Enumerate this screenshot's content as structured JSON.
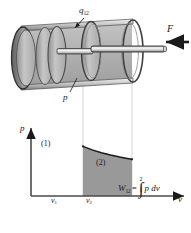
{
  "figure": {
    "colors": {
      "ink": "#1a1a1a",
      "cylinder_body": "#b8b8b8",
      "cylinder_shade_dark": "#6e6e6e",
      "cylinder_highlight": "#e2e2e2",
      "area_fill": "#999999",
      "projection_line": "#d2d2d2",
      "axis": "#4a4a4a"
    }
  },
  "apparatus": {
    "heat_label": "q",
    "heat_sub": "12",
    "force_label": "F",
    "pressure_label": "p",
    "parts": {
      "cylinder": "cylinder",
      "piston": "piston",
      "piston_rod": "piston-rod",
      "gas": "gas-volume"
    }
  },
  "chart_data": {
    "type": "area",
    "title": "",
    "xlabel": "v",
    "ylabel": "p",
    "grid": false,
    "legend": null,
    "xlim": [
      0,
      1
    ],
    "ylim": [
      0,
      1
    ],
    "x_tick_labels": [
      "v₁",
      "v₂"
    ],
    "x_ticks": [
      0.34,
      0.66
    ],
    "annotations": [
      {
        "text": "(1)",
        "x": 0.34,
        "y": 0.74
      },
      {
        "text": "(2)",
        "x": 0.66,
        "y": 0.5
      },
      {
        "text": "W12 = integral from 1 to 2 of p dv",
        "x": 0.82,
        "y": 0.3
      }
    ],
    "series": [
      {
        "name": "expansion path 1-2",
        "comment": "pressure decreases as volume increases; area beneath is the work",
        "x": [
          0.34,
          0.4,
          0.46,
          0.52,
          0.58,
          0.62,
          0.66
        ],
        "y": [
          0.73,
          0.678,
          0.637,
          0.603,
          0.573,
          0.556,
          0.54
        ]
      }
    ],
    "shaded_region": {
      "label": "work done W12",
      "from_x": 0.34,
      "to_x": 0.66,
      "fill": "#999999"
    }
  },
  "labels": {
    "state_1": "(1)",
    "state_2": "(2)",
    "v1_base": "v",
    "v1_sub": "1",
    "v2_base": "v",
    "v2_sub": "2",
    "p_axis": "p",
    "v_axis": "v",
    "equation": {
      "lhs_base": "W",
      "lhs_sub": "12",
      "equals": "=",
      "upper_limit": "2",
      "lower_limit": "1",
      "integrand": "p dv"
    }
  }
}
